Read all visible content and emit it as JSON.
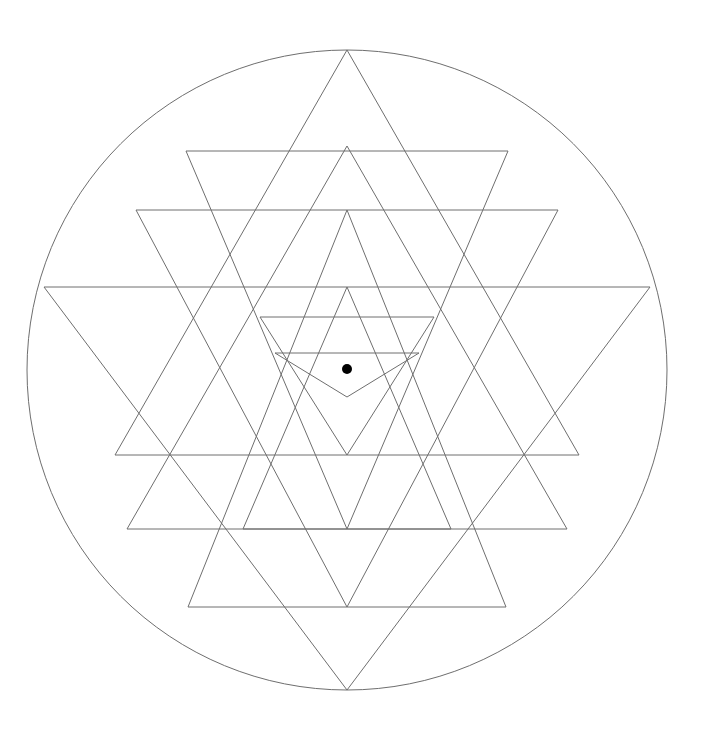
{
  "document": {
    "title": "Sri Yantra",
    "alt_title": "Shri Chakra geometric diagram",
    "background_color": "#ffffff",
    "canvas": {
      "width": 702,
      "height": 731
    }
  },
  "style": {
    "line_color": "#6e6e6e",
    "line_width": 1,
    "bindu_color": "#000000",
    "circle_color": "#6e6e6e"
  },
  "figure": {
    "type": "sri-yantra",
    "center": {
      "x": 347,
      "y": 370
    },
    "enclosing_circle": {
      "cx": 347,
      "cy": 370,
      "r": 320
    },
    "bindu": {
      "cx": 347,
      "cy": 369,
      "r": 5
    },
    "triangle_counts": {
      "upward": 4,
      "downward": 5,
      "total": 9
    },
    "upward_triangles": [
      {
        "name": "shiva-1-outer",
        "apex": {
          "x": 347,
          "y": 50
        },
        "base_y": 455,
        "left_x": 115,
        "right_x": 579
      },
      {
        "name": "shiva-2",
        "apex": {
          "x": 347,
          "y": 146
        },
        "base_y": 529,
        "left_x": 127,
        "right_x": 567
      },
      {
        "name": "shiva-3",
        "apex": {
          "x": 347,
          "y": 210
        },
        "base_y": 607,
        "left_x": 188,
        "right_x": 506
      },
      {
        "name": "shiva-4-inner",
        "apex": {
          "x": 347,
          "y": 287
        },
        "base_y": 529,
        "left_x": 243,
        "right_x": 451
      }
    ],
    "downward_triangles": [
      {
        "name": "shakti-1-outer",
        "apex": {
          "x": 347,
          "y": 690
        },
        "base_y": 287,
        "left_x": 44,
        "right_x": 650
      },
      {
        "name": "shakti-2",
        "apex": {
          "x": 347,
          "y": 607
        },
        "base_y": 210,
        "left_x": 136,
        "right_x": 558
      },
      {
        "name": "shakti-3",
        "apex": {
          "x": 347,
          "y": 529
        },
        "base_y": 151,
        "left_x": 186,
        "right_x": 508
      },
      {
        "name": "shakti-4",
        "apex": {
          "x": 347,
          "y": 455
        },
        "base_y": 317,
        "left_x": 260,
        "right_x": 434
      },
      {
        "name": "shakti-5-inner",
        "apex": {
          "x": 347,
          "y": 397
        },
        "base_y": 353,
        "left_x": 275,
        "right_x": 419
      }
    ],
    "horizontal_base_lines_y": [
      151,
      210,
      287,
      317,
      353,
      455,
      529,
      607
    ],
    "apex_points_y": [
      50,
      146,
      210,
      287,
      397,
      455,
      529,
      607,
      690
    ]
  }
}
